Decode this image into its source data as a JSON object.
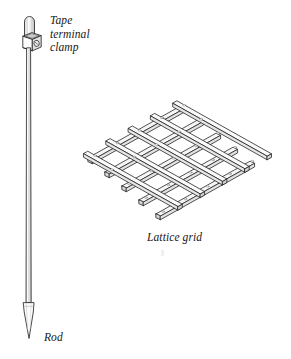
{
  "figure": {
    "background_color": "#ffffff",
    "line_color": "#1a1a1a",
    "fill_color": "#f7f7f7",
    "shade_color": "#dcdcdc",
    "labels": {
      "tape_terminal_clamp": "Tape\nterminal\nclamp",
      "lattice_grid": "Lattice grid",
      "rod": "Rod"
    },
    "parts": [
      {
        "name": "rod",
        "label": "Rod",
        "description": "vertical earthing rod with rounded top and pointed driving tip"
      },
      {
        "name": "tape-terminal-clamp",
        "label": "Tape terminal clamp",
        "description": "cubic clamp block fitted near top of rod"
      },
      {
        "name": "lattice-grid",
        "label": "Lattice grid",
        "description": "isometric grid of crossed flat bars, 5 bars by 5 bars forming 4 by 4 square openings"
      }
    ],
    "lattice": {
      "bars_per_direction": 5,
      "openings": "4 x 4"
    }
  }
}
